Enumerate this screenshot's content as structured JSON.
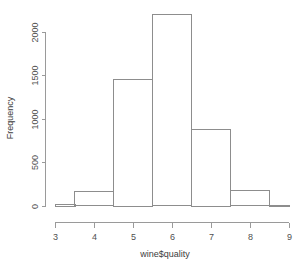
{
  "chart_data": {
    "type": "bar",
    "title": "",
    "subtitle": "",
    "xlabel": "wine$quality",
    "ylabel": "Frequency",
    "categories": [
      "3",
      "4",
      "5",
      "6",
      "7",
      "8",
      "9"
    ],
    "bin_edges": [
      2.5,
      3.5,
      4.5,
      5.5,
      6.5,
      7.5,
      8.5,
      9.0
    ],
    "bin_centers": [
      3,
      4,
      5,
      6,
      7,
      8,
      9
    ],
    "values": [
      20,
      163,
      1457,
      2198,
      880,
      175,
      5
    ],
    "xlim": [
      3,
      9
    ],
    "ylim": [
      0,
      2300
    ],
    "xticks": [
      3,
      4,
      5,
      6,
      7,
      8,
      9
    ],
    "xtick_labels": [
      "3",
      "4",
      "5",
      "6",
      "7",
      "8",
      "9"
    ],
    "yticks": [
      0,
      500,
      1000,
      1500,
      2000
    ],
    "ytick_labels": [
      "0",
      "500",
      "1000",
      "1500",
      "2000"
    ],
    "grid": false,
    "legend": null,
    "legend_position": "none",
    "bar_fill": "#ffffff",
    "bar_stroke": "#8d8d8d",
    "axis_color": "#9a9a9a",
    "text_color": "#4f4f4f",
    "background": "#ffffff"
  },
  "labels": {
    "x_axis_title": "wine$quality",
    "y_axis_title": "Frequency"
  }
}
